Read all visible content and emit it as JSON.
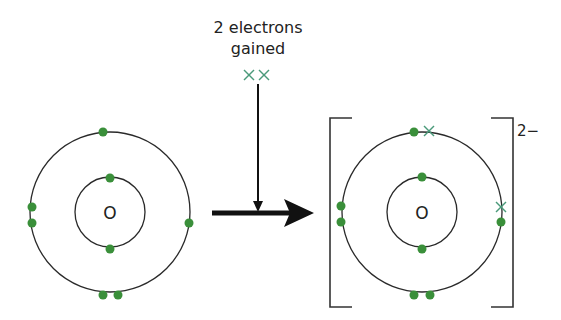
{
  "title_line1": "2 electrons",
  "title_line2": "gained",
  "gained_marks": "××",
  "atom_left": {
    "symbol": "O"
  },
  "atom_right": {
    "symbol": "O",
    "charge": "2−"
  },
  "colors": {
    "electron": "#3a8f3a",
    "gained_electron": "#4a9a7a",
    "line": "#222222"
  }
}
